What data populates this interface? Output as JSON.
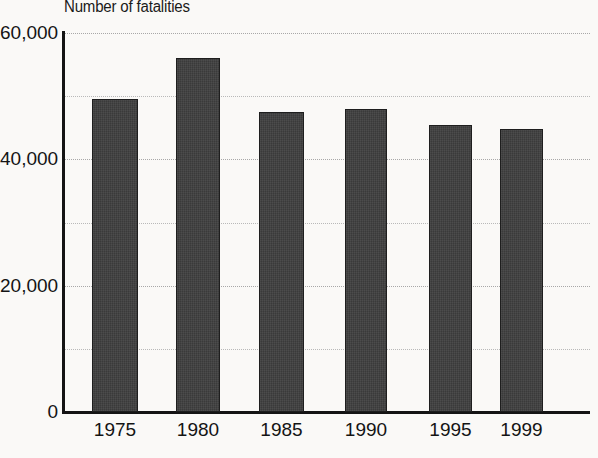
{
  "chart_data": {
    "type": "bar",
    "title": "Number of fatalities",
    "xlabel": "",
    "ylabel": "",
    "categories": [
      "1975",
      "1980",
      "1985",
      "1990",
      "1995",
      "1999"
    ],
    "values": [
      49500,
      56000,
      47500,
      48000,
      45500,
      44800
    ],
    "ylim": [
      0,
      60000
    ],
    "y_major_ticks": [
      "0",
      "20,000",
      "40,000",
      "60,000"
    ],
    "y_major_tick_values": [
      0,
      20000,
      40000,
      60000
    ],
    "y_gridline_values": [
      10000,
      20000,
      30000,
      40000,
      50000,
      60000
    ],
    "grid": true,
    "legend": "none",
    "series_color": "#3a3a3a",
    "axis_color": "#141414",
    "gridline_color": "#b9b9b9",
    "background_color": "#faf9f7"
  },
  "labels": {
    "y_ticks": [
      {
        "text": "60,000",
        "value": 60000
      },
      {
        "text": "40,000",
        "value": 40000
      },
      {
        "text": "20,000",
        "value": 20000
      },
      {
        "text": "0",
        "value": 0
      }
    ]
  }
}
